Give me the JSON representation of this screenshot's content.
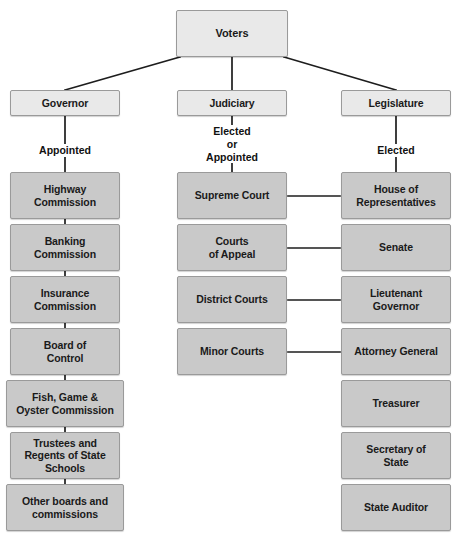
{
  "diagram": {
    "background_color": "#ffffff",
    "root": {
      "label": "Voters"
    },
    "branches": [
      {
        "label": "Governor",
        "selection_label": "Appointed"
      },
      {
        "label": "Judiciary",
        "selection_label": "Elected\nor\nAppointed"
      },
      {
        "label": "Legislature",
        "selection_label": "Elected"
      }
    ],
    "columns": {
      "executive": {
        "header": "Governor",
        "connector": "Appointed",
        "items": [
          "Highway\nCommission",
          "Banking\nCommission",
          "Insurance\nCommission",
          "Board of\nControl",
          "Fish, Game &\nOyster Commission",
          "Trustees and\nRegents of State\nSchools",
          "Other boards and\ncommissions"
        ]
      },
      "judicial": {
        "header": "Judiciary",
        "connector": "Elected\nor\nAppointed",
        "items": [
          "Supreme Court",
          "Courts\nof Appeal",
          "District Courts",
          "Minor Courts"
        ]
      },
      "legislative": {
        "header": "Legislature",
        "connector": "Elected",
        "items": [
          "House of\nRepresentatives",
          "Senate",
          "Lieutenant\nGovernor",
          "Attorney General",
          "Treasurer",
          "Secretary of\nState",
          "State Auditor"
        ]
      }
    },
    "cross_links": [
      {
        "from": "Supreme Court",
        "to": "House of\nRepresentatives"
      },
      {
        "from": "Courts\nof Appeal",
        "to": "Senate"
      },
      {
        "from": "District Courts",
        "to": "Lieutenant\nGovernor"
      },
      {
        "from": "Minor Courts",
        "to": "Attorney General"
      }
    ],
    "colors": {
      "box_light": "#e9e9e9",
      "box_gray": "#c9c9c9",
      "border": "#9a9a9a",
      "line": "#1d1d1d",
      "text": "#1a1a1a"
    }
  }
}
